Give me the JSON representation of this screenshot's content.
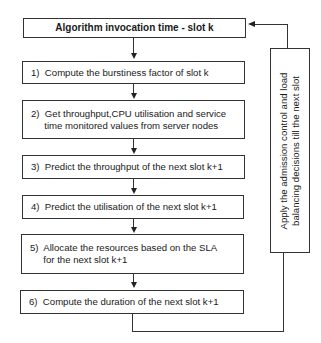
{
  "diagram": {
    "title": "Algorithm invocation time - slot k",
    "steps": [
      {
        "number": "1)",
        "lines": [
          "Compute the burstiness factor of slot k"
        ]
      },
      {
        "number": "2)",
        "lines": [
          "Get throughput,CPU utilisation and service",
          "time monitored values from server nodes"
        ]
      },
      {
        "number": "3)",
        "lines": [
          "Predict the throughput of the next slot k+1"
        ]
      },
      {
        "number": "4)",
        "lines": [
          "Predict the utilisation of the next slot k+1"
        ]
      },
      {
        "number": "5)",
        "lines": [
          "Allocate the resources based on the SLA",
          "for the next slot k+1"
        ]
      },
      {
        "number": "6)",
        "lines": [
          "Compute the duration of the next slot k+1"
        ]
      }
    ],
    "feedback": {
      "lines": [
        "Apply the admission control and load",
        "balancing decisions till the next slot"
      ]
    }
  },
  "step_text": {
    "s1": "1)  Compute the burstiness factor of slot k",
    "s2": "2)  Get throughput,CPU utilisation and service\n     time monitored values from server nodes",
    "s3": "3)  Predict the throughput of the next slot k+1",
    "s4": "4)  Predict the utilisation of the next slot k+1",
    "s5": "5)  Allocate the resources based on the SLA\n     for the next slot k+1",
    "s6": "6)  Compute the duration of the next slot k+1",
    "feedback": "Apply the admission control and load\nbalancing decisions till the next slot"
  }
}
